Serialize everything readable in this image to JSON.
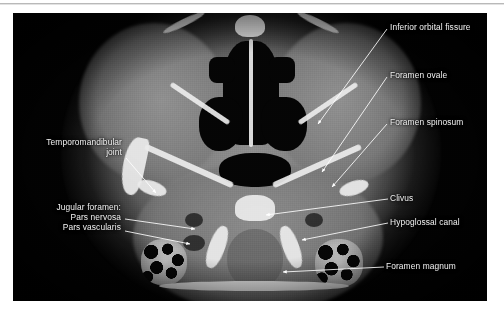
{
  "figure": {
    "modality": "axial-ct-skull-base",
    "panel_background": "#030303",
    "label_color": "#f2f2f2",
    "leader_color": "#ffffff"
  },
  "annotations": {
    "right_column": [
      {
        "id": "inferior-orbital-fissure",
        "text": "Inferior orbital fissure",
        "x": 390,
        "y": 22
      },
      {
        "id": "foramen-ovale",
        "text": "Foramen ovale",
        "x": 390,
        "y": 70
      },
      {
        "id": "foramen-spinosum",
        "text": "Foramen spinosum",
        "x": 390,
        "y": 117
      },
      {
        "id": "clivus",
        "text": "Clivus",
        "x": 390,
        "y": 193
      },
      {
        "id": "hypoglossal-canal",
        "text": "Hypoglossal canal",
        "x": 390,
        "y": 217
      },
      {
        "id": "foramen-magnum",
        "text": "Foramen magnum",
        "x": 386,
        "y": 261
      }
    ],
    "left_column": {
      "temporomandibular": {
        "id": "temporomandibular-joint",
        "line1": "Temporomandibular",
        "line2": "joint",
        "right_edge_x": 122,
        "y": 137
      },
      "jugular": {
        "id": "jugular-foramen",
        "heading": "Jugular foramen:",
        "items": [
          "Pars nervosa",
          "Pars vascularis"
        ],
        "right_edge_x": 121,
        "y": 202
      }
    }
  },
  "leaders": [
    {
      "id": "leader-inferior-orbital-fissure",
      "x1": 387,
      "y1": 29,
      "x2": 318,
      "y2": 124
    },
    {
      "id": "leader-foramen-ovale",
      "x1": 387,
      "y1": 77,
      "x2": 322,
      "y2": 172
    },
    {
      "id": "leader-foramen-spinosum",
      "x1": 387,
      "y1": 124,
      "x2": 332,
      "y2": 187
    },
    {
      "id": "leader-clivus",
      "x1": 388,
      "y1": 199,
      "x2": 266,
      "y2": 215
    },
    {
      "id": "leader-hypoglossal-canal",
      "x1": 388,
      "y1": 223,
      "x2": 302,
      "y2": 240
    },
    {
      "id": "leader-foramen-magnum",
      "x1": 384,
      "y1": 267,
      "x2": 283,
      "y2": 272
    },
    {
      "id": "leader-temporomandibular-joint",
      "x1": 126,
      "y1": 158,
      "x2": 156,
      "y2": 193
    },
    {
      "id": "leader-pars-nervosa",
      "x1": 125,
      "y1": 219,
      "x2": 195,
      "y2": 229
    },
    {
      "id": "leader-pars-vascularis",
      "x1": 125,
      "y1": 231,
      "x2": 190,
      "y2": 244
    }
  ]
}
